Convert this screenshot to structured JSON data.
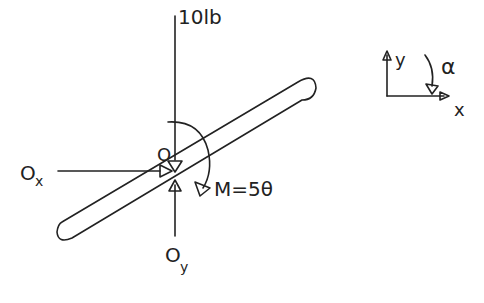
{
  "diagram": {
    "type": "free-body-diagram",
    "style": "hand-drawn",
    "ink_color": "#222222",
    "background": "#ffffff",
    "forces": {
      "weight": {
        "label": "10lb",
        "direction": "down"
      },
      "ox": {
        "label_main": "O",
        "label_sub": "x",
        "direction": "right"
      },
      "oy": {
        "label_main": "O",
        "label_sub": "y",
        "direction": "up"
      }
    },
    "point": {
      "label": "O"
    },
    "moment": {
      "label": "M=5θ",
      "direction": "clockwise"
    },
    "axes": {
      "x_label": "x",
      "y_label": "y",
      "angular_label": "α"
    },
    "bar": {
      "description": "inclined rigid bar pinned at O"
    }
  }
}
